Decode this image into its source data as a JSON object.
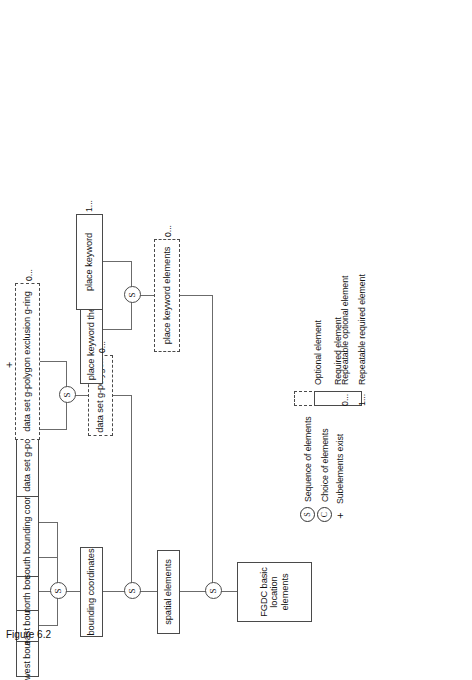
{
  "figure": {
    "caption": "Figure 6.2"
  },
  "diagram": {
    "type": "tree",
    "orientation": "rotated-90-ccw",
    "nodes": [
      {
        "id": "root",
        "label": "FGDC basic\nlocation elements",
        "style": "solid"
      },
      {
        "id": "spatial",
        "label": "spatial elements",
        "style": "solid"
      },
      {
        "id": "placekw_elems",
        "label": "place keyword elements",
        "style": "dashed",
        "multiplicity": "0..."
      },
      {
        "id": "bounding",
        "label": "bounding coordinates",
        "style": "solid"
      },
      {
        "id": "gpolygon",
        "label": "data set g-polygon",
        "style": "dashed",
        "multiplicity": "0..."
      },
      {
        "id": "west",
        "label": "west bounding coordinates",
        "style": "solid"
      },
      {
        "id": "east",
        "label": "east bounding coordinates",
        "style": "solid"
      },
      {
        "id": "north",
        "label": "north bounding coordinates",
        "style": "solid"
      },
      {
        "id": "south",
        "label": "south bounding coordinates",
        "style": "solid"
      },
      {
        "id": "outer_gring",
        "label": "data set g-polygon outer g-ring",
        "style": "solid",
        "operator": "+"
      },
      {
        "id": "excl_gring",
        "label": "data set g-polygon exclusion g-ring",
        "style": "dashed",
        "multiplicity": "0..."
      },
      {
        "id": "thesaurus",
        "label": "place keyword thesaurus",
        "style": "solid"
      },
      {
        "id": "place_keyword",
        "label": "place keyword",
        "style": "solid",
        "multiplicity": "1..."
      }
    ],
    "junctions": [
      {
        "id": "j_root",
        "symbol": "S"
      },
      {
        "id": "j_spatial",
        "symbol": "S"
      },
      {
        "id": "j_bounding",
        "symbol": "S"
      },
      {
        "id": "j_gpolygon",
        "symbol": "S"
      },
      {
        "id": "j_placekw",
        "symbol": "S"
      }
    ]
  },
  "legend": {
    "symbols": [
      {
        "glyph": "S",
        "kind": "circle",
        "label": "Sequence of elements"
      },
      {
        "glyph": "C",
        "kind": "circle",
        "label": "Choice of elements"
      },
      {
        "glyph": "+",
        "kind": "plus",
        "label": "Subelements exist"
      }
    ],
    "boxes": [
      {
        "style": "dashed",
        "label": "Optional element"
      },
      {
        "style": "solid",
        "label": "Required element"
      }
    ],
    "multiplicities": [
      {
        "glyph": "0...",
        "label": "Repeatable optional element"
      },
      {
        "glyph": "1...",
        "label": "Repeatable required element"
      }
    ]
  },
  "colors": {
    "line": "#6b6b6b",
    "border": "#4a4a4a",
    "text": "#111111",
    "background": "#ffffff"
  }
}
